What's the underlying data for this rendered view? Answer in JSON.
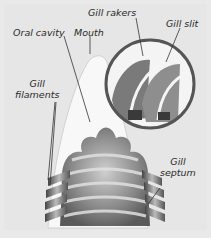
{
  "diagram": {
    "labels": {
      "gill_rakers": "Gill rakers",
      "gill_slit": "Gill slit",
      "oral_cavity": "Oral cavity",
      "mouth": "Mouth",
      "gill_filaments_line1": "Gill",
      "gill_filaments_line2": "filaments",
      "gill_septum_line1": "Gill",
      "gill_septum_line2": "septum"
    },
    "colors": {
      "background": "#e6e6e6",
      "body_fill": "#f7f7f7",
      "gill_dark": "#555555",
      "gill_mid": "#8a8a8a",
      "circle_border": "#555555",
      "text": "#2a2a2a"
    }
  }
}
